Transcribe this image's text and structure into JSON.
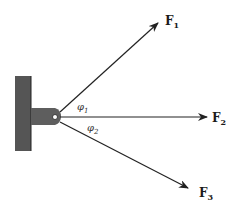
{
  "diagram": {
    "type": "force-vectors-on-bracket",
    "colors": {
      "wall": "#555555",
      "bracket": "#5e5e5e",
      "line": "#222222",
      "background": "#ffffff"
    },
    "forces": [
      {
        "name": "F",
        "sub": "1"
      },
      {
        "name": "F",
        "sub": "2"
      },
      {
        "name": "F",
        "sub": "3"
      }
    ],
    "angles": [
      {
        "symbol": "φ",
        "sub": "1"
      },
      {
        "symbol": "φ",
        "sub": "2"
      }
    ]
  }
}
